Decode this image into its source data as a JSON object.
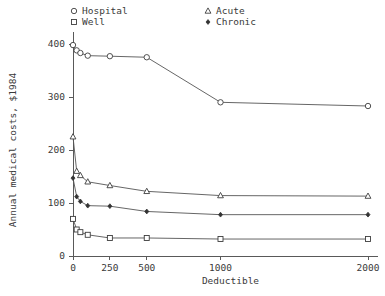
{
  "chart_data": {
    "type": "line",
    "title": "",
    "xlabel": "Deductible",
    "ylabel": "Annual medical costs, $1984",
    "xlim": [
      0,
      2100
    ],
    "ylim": [
      0,
      430
    ],
    "xticks": [
      0,
      250,
      500,
      1000,
      2000
    ],
    "xtick_labels": [
      "0",
      "250",
      "500",
      "1000",
      "2000"
    ],
    "yticks": [
      0,
      100,
      200,
      300,
      400
    ],
    "ytick_labels": [
      "0",
      "100",
      "200",
      "300",
      "400"
    ],
    "grid": false,
    "legend_position": "top",
    "x": [
      0,
      25,
      50,
      100,
      250,
      500,
      1000,
      2000
    ],
    "series": [
      {
        "name": "Hospital",
        "marker": "circle-open",
        "values": [
          398,
          388,
          383,
          378,
          377,
          375,
          290,
          283
        ]
      },
      {
        "name": "Well",
        "marker": "square-open",
        "values": [
          70,
          50,
          45,
          40,
          34,
          34,
          32,
          32
        ]
      },
      {
        "name": "Acute",
        "marker": "triangle-open",
        "values": [
          225,
          160,
          152,
          140,
          133,
          122,
          114,
          113
        ]
      },
      {
        "name": "Chronic",
        "marker": "diamond-filled",
        "values": [
          147,
          112,
          103,
          95,
          94,
          84,
          78,
          78
        ]
      }
    ]
  },
  "legend": {
    "entries": [
      {
        "label": "Hospital",
        "marker": "circle-open"
      },
      {
        "label": "Well",
        "marker": "square-open"
      },
      {
        "label": "Acute",
        "marker": "triangle-open"
      },
      {
        "label": "Chronic",
        "marker": "diamond-filled"
      }
    ]
  },
  "colors": {
    "axis": "#595959",
    "line": "#555555",
    "marker_stroke": "#3d3d3d",
    "marker_fill_open": "#ffffff",
    "marker_fill_solid": "#333333",
    "background": "#ffffff",
    "text": "#3a3a3a"
  }
}
